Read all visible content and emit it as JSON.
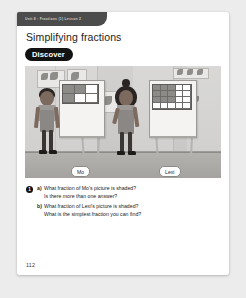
{
  "page": {
    "running_head": "Unit 8 : Fractions (1)  Lesson 2",
    "title": "Simplifying fractions",
    "badge_label": "Discover",
    "folio": "112",
    "background_color": "#ececec",
    "card_color": "#ffffff",
    "accent_color": "#121212"
  },
  "illustration": {
    "name": "classroom-scene",
    "description": "Two children standing in a classroom next to easels displaying shaded fraction grids",
    "wall_color": "#d2d1cf",
    "floor_color": "#b4b2af",
    "children": [
      {
        "name_tag": "Mo",
        "grid": {
          "columns": 3,
          "rows": 2,
          "shaded_cells": [
            0,
            1,
            3
          ]
        }
      },
      {
        "name_tag": "Lexi",
        "grid": {
          "columns": 5,
          "rows": 4,
          "shaded_cells": [
            0,
            1,
            2,
            5,
            6,
            7,
            10,
            11,
            12
          ]
        }
      }
    ]
  },
  "questions": {
    "number": "1",
    "items": [
      {
        "label": "a)",
        "text": "What fraction of Mo's picture is shaded?",
        "follow_up": "Is there more than one answer?"
      },
      {
        "label": "b)",
        "text": "What fraction of Lexi's picture is shaded?",
        "follow_up": "What is the simplest fraction you can find?"
      }
    ]
  }
}
